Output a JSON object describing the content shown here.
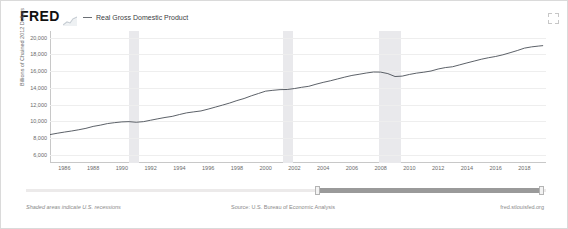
{
  "header": {
    "logo_text": "FRED",
    "logo_spark_icon": "sparkline-icon",
    "expand_icon": "expand-fullscreen-icon",
    "legend": [
      {
        "label": "Real Gross Domestic Product",
        "marker": "dashed-line",
        "color": "#6b6f75"
      }
    ]
  },
  "footer": {
    "note": "Shaded areas indicate U.S. recessions",
    "source": "Source: U.S. Bureau of Economic Analysis",
    "url": "fred.stlouisfed.org"
  },
  "range_slider": {
    "left_handle_label": "",
    "right_handle_label": "",
    "fill_start_pct": 56,
    "fill_end_pct": 99
  },
  "chart_data": {
    "type": "line",
    "title": "Real Gross Domestic Product",
    "xlabel": "",
    "ylabel": "Billions of Chained 2012 Dollars",
    "ylim": [
      5000,
      20800
    ],
    "yticks": [
      20000,
      18000,
      16000,
      14000,
      12000,
      10000,
      8000,
      6000
    ],
    "ytick_labels": [
      "20,000",
      "18,000",
      "16,000",
      "14,000",
      "12,000",
      "10,000",
      "8,000",
      "6,000"
    ],
    "xlim": [
      1985.0,
      2019.5
    ],
    "xticks": [
      1986,
      1988,
      1990,
      1992,
      1994,
      1996,
      1998,
      2000,
      2002,
      2004,
      2006,
      2008,
      2010,
      2012,
      2014,
      2016,
      2018
    ],
    "xtick_labels": [
      "1986",
      "1988",
      "1990",
      "1992",
      "1994",
      "1996",
      "1998",
      "2000",
      "2002",
      "2004",
      "2006",
      "2008",
      "2010",
      "2012",
      "2014",
      "2016",
      "2018"
    ],
    "grid": true,
    "legend_position": "top-left",
    "line_color": "#4a4f57",
    "recession_color": "#e9e9ec",
    "recessions": [
      {
        "start": 1990.5,
        "end": 1991.2
      },
      {
        "start": 2001.2,
        "end": 2001.9
      },
      {
        "start": 2007.9,
        "end": 2009.4
      }
    ],
    "series": [
      {
        "name": "Real Gross Domestic Product",
        "x": [
          1985.0,
          1985.5,
          1986.0,
          1986.5,
          1987.0,
          1987.5,
          1988.0,
          1988.5,
          1989.0,
          1989.5,
          1990.0,
          1990.5,
          1991.0,
          1991.5,
          1992.0,
          1992.5,
          1993.0,
          1993.5,
          1994.0,
          1994.5,
          1995.0,
          1995.5,
          1996.0,
          1996.5,
          1997.0,
          1997.5,
          1998.0,
          1998.5,
          1999.0,
          1999.5,
          2000.0,
          2000.5,
          2001.0,
          2001.5,
          2002.0,
          2002.5,
          2003.0,
          2003.5,
          2004.0,
          2004.5,
          2005.0,
          2005.5,
          2006.0,
          2006.5,
          2007.0,
          2007.5,
          2008.0,
          2008.5,
          2009.0,
          2009.5,
          2010.0,
          2010.5,
          2011.0,
          2011.5,
          2012.0,
          2012.5,
          2013.0,
          2013.5,
          2014.0,
          2014.5,
          2015.0,
          2015.5,
          2016.0,
          2016.5,
          2017.0,
          2017.5,
          2018.0,
          2018.5,
          2019.0,
          2019.3
        ],
        "values": [
          8400,
          8560,
          8700,
          8830,
          8980,
          9150,
          9380,
          9530,
          9720,
          9830,
          9920,
          9950,
          9880,
          9950,
          10120,
          10290,
          10450,
          10580,
          10800,
          11000,
          11120,
          11230,
          11450,
          11690,
          11930,
          12180,
          12470,
          12720,
          13040,
          13320,
          13600,
          13700,
          13780,
          13800,
          13910,
          14060,
          14180,
          14430,
          14650,
          14840,
          15060,
          15280,
          15480,
          15620,
          15770,
          15890,
          15880,
          15700,
          15350,
          15400,
          15600,
          15760,
          15870,
          16010,
          16250,
          16420,
          16520,
          16750,
          16980,
          17200,
          17420,
          17600,
          17750,
          17950,
          18200,
          18460,
          18750,
          18900,
          19000,
          19050
        ]
      }
    ]
  }
}
